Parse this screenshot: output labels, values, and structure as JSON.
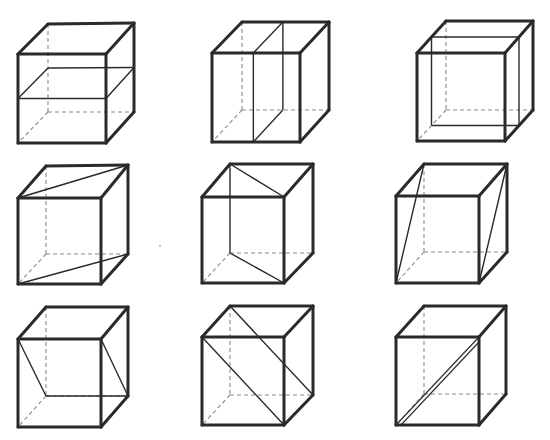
{
  "figure": {
    "colors": {
      "edge": "#2a2a2a",
      "hidden": "#8a8a8a",
      "background": "#ffffff"
    },
    "cubes": [
      {
        "id": 1,
        "row": 1,
        "col": 1,
        "section": "horizontal-mid",
        "F": [
          [
            18,
            54
          ],
          [
            106,
            54
          ],
          [
            106,
            143
          ],
          [
            18,
            143
          ]
        ],
        "B": [
          [
            48,
            24
          ],
          [
            134,
            23
          ],
          [
            134,
            112
          ],
          [
            48,
            112
          ]
        ]
      },
      {
        "id": 2,
        "row": 1,
        "col": 2,
        "section": "vertical-side-parallel",
        "F": [
          [
            212,
            53
          ],
          [
            300,
            53
          ],
          [
            300,
            142
          ],
          [
            212,
            142
          ]
        ],
        "B": [
          [
            242,
            22
          ],
          [
            329,
            22
          ],
          [
            329,
            110
          ],
          [
            242,
            110
          ]
        ]
      },
      {
        "id": 3,
        "row": 1,
        "col": 3,
        "section": "vertical-front-parallel",
        "F": [
          [
            417,
            53
          ],
          [
            505,
            53
          ],
          [
            505,
            141
          ],
          [
            417,
            141
          ]
        ],
        "B": [
          [
            446,
            21
          ],
          [
            533,
            21
          ],
          [
            533,
            110
          ],
          [
            446,
            110
          ]
        ]
      },
      {
        "id": 4,
        "row": 2,
        "col": 1,
        "section": "diagonal-top-bottom",
        "F": [
          [
            18,
            198
          ],
          [
            101,
            198
          ],
          [
            101,
            284
          ],
          [
            18,
            284
          ]
        ],
        "B": [
          [
            46,
            166
          ],
          [
            128,
            165
          ],
          [
            128,
            254
          ],
          [
            46,
            254
          ]
        ]
      },
      {
        "id": 5,
        "row": 2,
        "col": 2,
        "section": "diagonal-back-left-to-front-right",
        "F": [
          [
            202,
            197
          ],
          [
            284,
            197
          ],
          [
            284,
            283
          ],
          [
            202,
            283
          ]
        ],
        "B": [
          [
            230,
            164
          ],
          [
            313,
            164
          ],
          [
            313,
            253
          ],
          [
            230,
            253
          ]
        ]
      },
      {
        "id": 6,
        "row": 2,
        "col": 3,
        "section": "diagonal-front-bottom-to-back-top",
        "F": [
          [
            396,
            196
          ],
          [
            479,
            196
          ],
          [
            479,
            283
          ],
          [
            396,
            283
          ]
        ],
        "B": [
          [
            424,
            164
          ],
          [
            507,
            164
          ],
          [
            507,
            252
          ],
          [
            424,
            252
          ]
        ]
      },
      {
        "id": 7,
        "row": 3,
        "col": 1,
        "section": "diagonal-front-top-to-back-bottom",
        "F": [
          [
            18,
            339
          ],
          [
            101,
            339
          ],
          [
            101,
            427
          ],
          [
            18,
            427
          ]
        ],
        "B": [
          [
            46,
            307
          ],
          [
            128,
            307
          ],
          [
            128,
            396
          ],
          [
            46,
            396
          ]
        ]
      },
      {
        "id": 8,
        "row": 3,
        "col": 2,
        "section": "diagonal-left-top-to-right-bottom",
        "F": [
          [
            202,
            337
          ],
          [
            284,
            337
          ],
          [
            284,
            425
          ],
          [
            202,
            425
          ]
        ],
        "B": [
          [
            230,
            306
          ],
          [
            313,
            306
          ],
          [
            313,
            395
          ],
          [
            230,
            395
          ]
        ]
      },
      {
        "id": 9,
        "row": 3,
        "col": 3,
        "section": "thin-diagonal-front-face",
        "F": [
          [
            396,
            337
          ],
          [
            479,
            337
          ],
          [
            479,
            425
          ],
          [
            396,
            425
          ]
        ],
        "B": [
          [
            424,
            306
          ],
          [
            506,
            306
          ],
          [
            506,
            394
          ],
          [
            424,
            394
          ]
        ]
      }
    ]
  }
}
